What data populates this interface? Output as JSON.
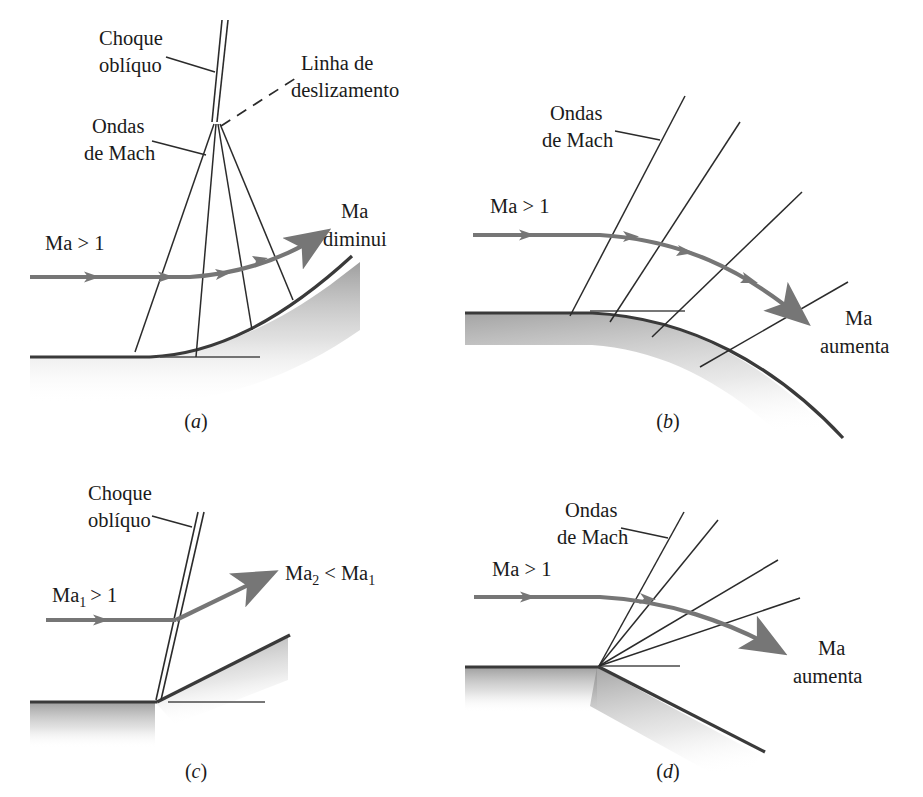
{
  "figure": {
    "colors": {
      "flow_arrow": "#767676",
      "wave_line": "#2b2b2b",
      "wall_line": "#3a3a3a",
      "wall_shadow": "#9a9a9a",
      "background": "#ffffff",
      "text": "#1a1a1a"
    }
  },
  "panels": [
    {
      "id": "a",
      "caption": "(a)",
      "labels": {
        "shock": "Choque\noblíquo",
        "shock_line1": "Choque",
        "shock_line2": "oblíquo",
        "slip_line1": "Linha de",
        "slip_line2": "deslizamento",
        "mach_line1": "Ondas",
        "mach_line2": "de Mach",
        "inflow": "Ma > 1",
        "outflow_line1": "Ma",
        "outflow_line2": "diminui"
      },
      "description": "Gradual concave turn: Mach waves coalesce into an oblique shock with a slip line",
      "mach_wave_count": 3
    },
    {
      "id": "b",
      "caption": "(b)",
      "labels": {
        "mach_line1": "Ondas",
        "mach_line2": "de Mach",
        "inflow": "Ma > 1",
        "outflow_line1": "Ma",
        "outflow_line2": "aumenta"
      },
      "description": "Gradual convex turn: diverging Mach waves, flow accelerates",
      "mach_wave_count": 4
    },
    {
      "id": "c",
      "caption": "(c)",
      "labels": {
        "shock_line1": "Choque",
        "shock_line2": "oblíquo",
        "inflow_base": "Ma",
        "inflow_sub": "1",
        "inflow_rest": "> 1",
        "inflow": "Ma₁ > 1",
        "outflow": "Ma₂ < Ma₁",
        "out_base1": "Ma",
        "out_sub1": "2",
        "out_mid": "<",
        "out_base2": "Ma",
        "out_sub2": "1"
      },
      "description": "Sharp concave corner: single oblique shock, flow decelerates",
      "mach_wave_count": 0
    },
    {
      "id": "d",
      "caption": "(d)",
      "labels": {
        "mach_line1": "Ondas",
        "mach_line2": "de Mach",
        "inflow": "Ma > 1",
        "outflow_line1": "Ma",
        "outflow_line2": "aumenta"
      },
      "description": "Sharp convex corner: Prandtl-Meyer expansion fan, flow accelerates",
      "mach_wave_count": 4
    }
  ]
}
